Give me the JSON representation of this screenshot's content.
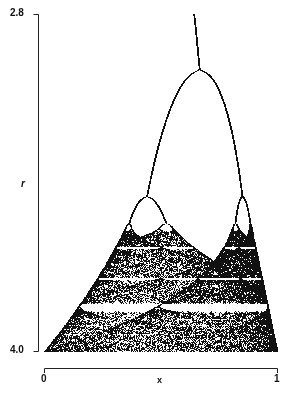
{
  "chart_data": {
    "type": "scatter",
    "title": "",
    "xlabel": "x",
    "ylabel": "r",
    "xlim": [
      0,
      1
    ],
    "ylim": [
      4.0,
      2.8
    ],
    "y_inverted": true,
    "x_ticks": [
      "0",
      "1"
    ],
    "y_ticks": [
      "2.8",
      "4.0"
    ],
    "grid": false,
    "legend": null,
    "features": {
      "period_doubling_r": [
        3.0,
        3.449,
        3.544
      ],
      "onset_of_chaos_r": 3.57,
      "period3_window_r": [
        3.828,
        3.857
      ],
      "point_color": "#111111",
      "background": "#ffffff"
    }
  },
  "labels": {
    "y_top": "2.8",
    "y_bottom": "4.0",
    "y_axis": "r",
    "x_left": "0",
    "x_right": "1",
    "x_axis": "x"
  },
  "layout": {
    "plot_left": 44,
    "plot_right": 277,
    "plot_top": 14,
    "plot_bottom": 351,
    "yaxis_x": 38,
    "xaxis_y": 368
  }
}
